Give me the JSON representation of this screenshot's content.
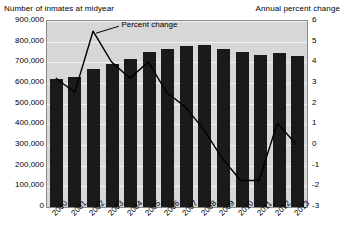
{
  "chart_data": {
    "type": "bar",
    "title": "",
    "left_axis_title": "Number of inmates at midyear",
    "right_axis_title": "Annual percent change",
    "xlabel": "",
    "ylabel": "Number of inmates at midyear",
    "y2label": "Annual percent change",
    "grid": true,
    "legend_position": "inline-annotation",
    "categories": [
      "2000",
      "2001",
      "2002",
      "2003",
      "2004",
      "2005",
      "2006",
      "2007",
      "2008",
      "2009",
      "2010",
      "2011",
      "2012",
      "2013"
    ],
    "ylim": [
      0,
      900000
    ],
    "yticks": [
      "0",
      "100,000",
      "200,000",
      "300,000",
      "400,000",
      "500,000",
      "600,000",
      "700,000",
      "800,000",
      "900,000"
    ],
    "ylim2": [
      -3,
      6
    ],
    "yticks2": [
      "-3",
      "-2",
      "-1",
      "0",
      "1",
      "2",
      "3",
      "4",
      "5",
      "6"
    ],
    "series": [
      {
        "name": "Number of inmates at midyear",
        "type": "bar",
        "axis": "left",
        "color": "#1a1a1a",
        "values": [
          621000,
          631000,
          666000,
          692000,
          714000,
          748000,
          766000,
          780000,
          786000,
          767000,
          749000,
          736000,
          745000,
          732000
        ]
      },
      {
        "name": "Percent change",
        "type": "line",
        "axis": "right",
        "color": "#000000",
        "values": [
          3.2,
          2.5,
          5.5,
          4.0,
          3.2,
          4.0,
          2.5,
          1.8,
          0.7,
          -0.7,
          -1.8,
          -1.8,
          1.0,
          0.0
        ]
      }
    ],
    "annotations": [
      {
        "text": "Percent change",
        "points_to_category": "2002"
      }
    ]
  }
}
